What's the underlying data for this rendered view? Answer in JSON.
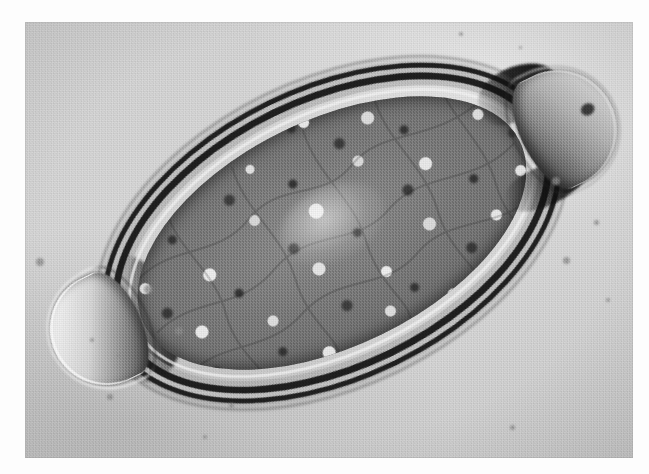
{
  "image": {
    "kind": "light-microscopy-photomicrograph",
    "color_mode": "grayscale",
    "width_px": 649,
    "height_px": 474,
    "subject": "Trichuris trichiura egg (whipworm), barrel-shaped with bipolar mucoid plugs",
    "alt_text": "Black and white photomicrograph of a barrel-shaped parasite egg tilted diagonally, showing a thick multi-layered shell, a transparent plug at each pole, and dense granular contents filling the interior.",
    "print": {
      "left_px": 25,
      "top_px": 22,
      "width_px": 608,
      "height_px": 436,
      "border_color": "#ffffff",
      "background_color": "#d4d4d4"
    },
    "palette": {
      "paper_white": "#ffffff",
      "field_light": "#e2e2e2",
      "field_mid": "#d2d2d2",
      "field_dark": "#bdbdbd",
      "shell_dark": "#121212",
      "shell_light_band": "#ededed",
      "contents_mid": "#7a7a7a",
      "granule_light": "#f2f2f2",
      "granule_dark": "#2b2b2b",
      "plug_highlight": "#f7f7f7",
      "plug_shadow": "#2c2c2c"
    },
    "specimen": {
      "rotation_deg": -26,
      "center_x_px": 320,
      "center_y_px": 228,
      "body_length_px": 490,
      "body_width_px": 294,
      "shell_layers": [
        "outer dark contour",
        "light refractile band",
        "inner dark vitelline line",
        "thin inner membrane"
      ],
      "features": [
        "left polar plug",
        "right polar plug",
        "granular unsegmented ovum",
        "refractile shell rim"
      ]
    },
    "debris_specks": [
      {
        "x": 40,
        "y": 262,
        "d": 8
      },
      {
        "x": 148,
        "y": 289,
        "d": 9
      },
      {
        "x": 179,
        "y": 331,
        "d": 8
      },
      {
        "x": 110,
        "y": 397,
        "d": 6
      },
      {
        "x": 92,
        "y": 340,
        "d": 4
      },
      {
        "x": 118,
        "y": 355,
        "d": 3
      },
      {
        "x": 231,
        "y": 405,
        "d": 5
      },
      {
        "x": 205,
        "y": 437,
        "d": 4
      },
      {
        "x": 556,
        "y": 181,
        "d": 8
      },
      {
        "x": 596,
        "y": 222,
        "d": 5
      },
      {
        "x": 566,
        "y": 260,
        "d": 7
      },
      {
        "x": 608,
        "y": 300,
        "d": 4
      },
      {
        "x": 512,
        "y": 427,
        "d": 5
      },
      {
        "x": 461,
        "y": 34,
        "d": 4
      },
      {
        "x": 520,
        "y": 47,
        "d": 3
      }
    ]
  }
}
